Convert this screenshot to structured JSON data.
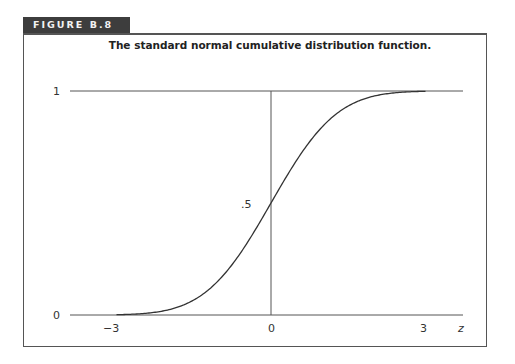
{
  "figure": {
    "label": "FIGURE B.8",
    "title": "The standard normal cumulative distribution function."
  },
  "chart_data": {
    "type": "line",
    "title": "The standard normal cumulative distribution function.",
    "xlabel": "z",
    "ylabel": "",
    "x_ticks": [
      "−3",
      "0",
      "3"
    ],
    "y_ticks": [
      "0",
      ".5",
      "1"
    ],
    "xlim": [
      -3.1,
      3.7
    ],
    "ylim": [
      0,
      1
    ],
    "grid": false,
    "legend": null,
    "series": [
      {
        "name": "Φ(z)",
        "x": [
          -3.0,
          -2.5,
          -2.0,
          -1.5,
          -1.0,
          -0.5,
          0.0,
          0.5,
          1.0,
          1.5,
          2.0,
          2.5,
          3.0
        ],
        "y": [
          0.0013,
          0.0062,
          0.0228,
          0.0668,
          0.1587,
          0.3085,
          0.5,
          0.6915,
          0.8413,
          0.9332,
          0.9772,
          0.9938,
          0.9987
        ]
      }
    ]
  }
}
